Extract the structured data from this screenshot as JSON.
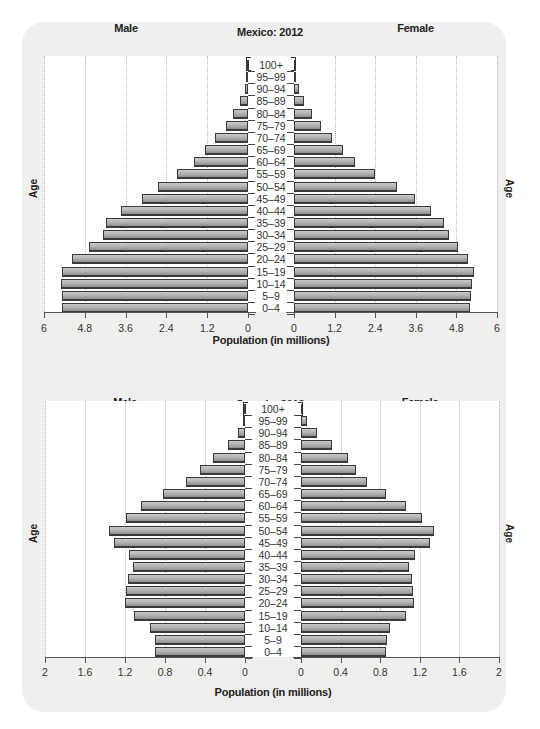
{
  "chart_data": [
    {
      "type": "bar",
      "subtype": "population-pyramid",
      "title": "Mexico: 2012",
      "left_label": "Male",
      "right_label": "Female",
      "ylabel": "Age",
      "xlabel": "Population (in millions)",
      "xlim": [
        0,
        6
      ],
      "x_ticks_left": [
        "6",
        "4.8",
        "3.6",
        "2.4",
        "1.2",
        "0"
      ],
      "x_ticks_right": [
        "0",
        "1.2",
        "2.4",
        "3.6",
        "4.8",
        "6"
      ],
      "grid": true,
      "categories": [
        "100+",
        "95–99",
        "90–94",
        "85–89",
        "80–84",
        "75–79",
        "70–74",
        "65–69",
        "60–64",
        "55–59",
        "50–54",
        "45–49",
        "40–44",
        "35–39",
        "30–34",
        "25–29",
        "20–24",
        "15–19",
        "10–14",
        "5–9",
        "0–4"
      ],
      "series": [
        {
          "name": "Male",
          "values": [
            0.02,
            0.05,
            0.1,
            0.23,
            0.44,
            0.65,
            0.97,
            1.26,
            1.59,
            2.09,
            2.65,
            3.12,
            3.74,
            4.18,
            4.26,
            4.68,
            5.18,
            5.47,
            5.5,
            5.47,
            5.47
          ]
        },
        {
          "name": "Female",
          "values": [
            0.03,
            0.06,
            0.14,
            0.29,
            0.52,
            0.79,
            1.12,
            1.44,
            1.8,
            2.39,
            3.04,
            3.57,
            4.05,
            4.43,
            4.58,
            4.85,
            5.14,
            5.32,
            5.27,
            5.24,
            5.21
          ]
        }
      ]
    },
    {
      "type": "bar",
      "subtype": "population-pyramid",
      "title": "Canada: 2012",
      "left_label": "Male",
      "right_label": "Female",
      "ylabel": "Age",
      "xlabel": "Population (in millions)",
      "xlim": [
        0,
        2
      ],
      "x_ticks_left": [
        "2",
        "1.6",
        "1.2",
        "0.8",
        "0.4",
        "0"
      ],
      "x_ticks_right": [
        "0",
        "0.4",
        "0.8",
        "1.2",
        "1.6",
        "2"
      ],
      "grid": true,
      "categories": [
        "100+",
        "95–99",
        "90–94",
        "85–89",
        "80–84",
        "75–79",
        "70–74",
        "65–69",
        "60–64",
        "55–59",
        "50–54",
        "45–49",
        "40–44",
        "35–39",
        "30–34",
        "25–29",
        "20–24",
        "15–19",
        "10–14",
        "5–9",
        "0–4"
      ],
      "series": [
        {
          "name": "Male",
          "values": [
            0.01,
            0.02,
            0.07,
            0.17,
            0.32,
            0.45,
            0.59,
            0.82,
            1.04,
            1.19,
            1.36,
            1.31,
            1.16,
            1.12,
            1.17,
            1.19,
            1.2,
            1.11,
            0.95,
            0.9,
            0.9
          ]
        },
        {
          "name": "Female",
          "values": [
            0.01,
            0.06,
            0.16,
            0.31,
            0.47,
            0.56,
            0.67,
            0.86,
            1.06,
            1.22,
            1.34,
            1.3,
            1.15,
            1.09,
            1.12,
            1.13,
            1.14,
            1.06,
            0.9,
            0.87,
            0.86
          ]
        }
      ]
    }
  ]
}
